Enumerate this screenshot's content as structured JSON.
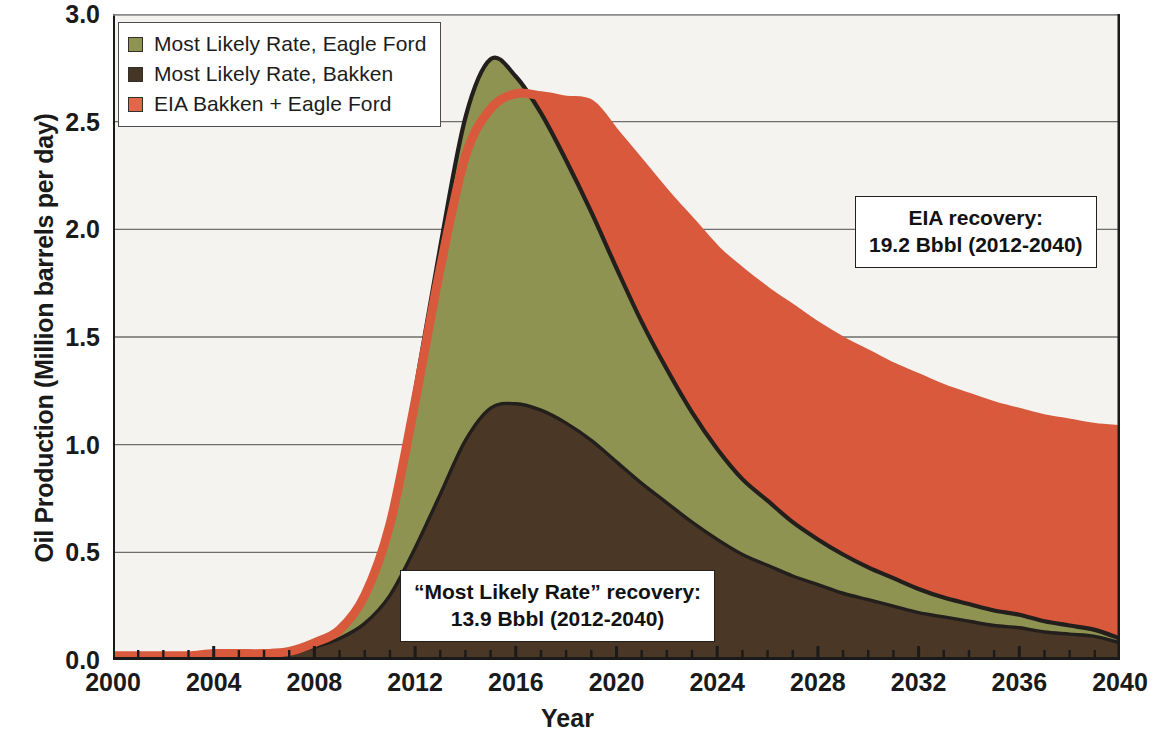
{
  "chart_data": {
    "type": "area",
    "title": "",
    "xlabel": "Year",
    "ylabel": "Oil Production (Million barrels per day)",
    "xlim": [
      2000,
      2040
    ],
    "ylim": [
      0.0,
      3.0
    ],
    "ytick_labels": [
      "0.0",
      "0.5",
      "1.0",
      "1.5",
      "2.0",
      "2.5",
      "3.0"
    ],
    "ytick_values": [
      0.0,
      0.5,
      1.0,
      1.5,
      2.0,
      2.5,
      3.0
    ],
    "xtick_labels": [
      "2000",
      "2004",
      "2008",
      "2012",
      "2016",
      "2020",
      "2024",
      "2028",
      "2032",
      "2036",
      "2040"
    ],
    "xtick_values": [
      2000,
      2004,
      2008,
      2012,
      2016,
      2020,
      2024,
      2028,
      2032,
      2036,
      2040
    ],
    "minor_xtick_interval": 1,
    "grid": "horizontal",
    "legend_position": "upper-left",
    "x": [
      2000,
      2001,
      2002,
      2003,
      2004,
      2005,
      2006,
      2007,
      2008,
      2009,
      2010,
      2011,
      2012,
      2013,
      2014,
      2015,
      2016,
      2017,
      2018,
      2019,
      2020,
      2021,
      2022,
      2023,
      2024,
      2025,
      2026,
      2027,
      2028,
      2029,
      2030,
      2031,
      2032,
      2033,
      2034,
      2035,
      2036,
      2037,
      2038,
      2039,
      2040
    ],
    "series": [
      {
        "name": "Most Likely Rate, Bakken",
        "color": "#4a3725",
        "stacking": "bottom-layer",
        "values": [
          0.01,
          0.01,
          0.01,
          0.01,
          0.02,
          0.02,
          0.02,
          0.03,
          0.06,
          0.1,
          0.17,
          0.3,
          0.52,
          0.77,
          1.02,
          1.17,
          1.19,
          1.16,
          1.1,
          1.02,
          0.92,
          0.82,
          0.73,
          0.64,
          0.56,
          0.49,
          0.44,
          0.39,
          0.35,
          0.31,
          0.28,
          0.25,
          0.22,
          0.2,
          0.18,
          0.16,
          0.15,
          0.13,
          0.12,
          0.11,
          0.08
        ]
      },
      {
        "name": "Most Likely Rate, Eagle Ford",
        "color": "#8e9352",
        "stacking": "stacked-on-bakken",
        "values": [
          0.0,
          0.0,
          0.0,
          0.0,
          0.0,
          0.0,
          0.0,
          0.0,
          0.01,
          0.03,
          0.12,
          0.33,
          0.73,
          1.15,
          1.5,
          1.62,
          1.52,
          1.38,
          1.22,
          1.06,
          0.9,
          0.75,
          0.62,
          0.51,
          0.42,
          0.35,
          0.3,
          0.25,
          0.21,
          0.18,
          0.15,
          0.13,
          0.11,
          0.09,
          0.08,
          0.07,
          0.06,
          0.05,
          0.04,
          0.03,
          0.02
        ]
      },
      {
        "name": "Most Likely Rate, Total",
        "color": "#231f1c",
        "stacking": "total-outline",
        "values": [
          0.01,
          0.01,
          0.01,
          0.01,
          0.02,
          0.02,
          0.02,
          0.03,
          0.07,
          0.13,
          0.29,
          0.63,
          1.25,
          1.92,
          2.52,
          2.79,
          2.71,
          2.54,
          2.32,
          2.08,
          1.82,
          1.57,
          1.35,
          1.15,
          0.98,
          0.84,
          0.74,
          0.64,
          0.56,
          0.49,
          0.43,
          0.38,
          0.33,
          0.29,
          0.26,
          0.23,
          0.21,
          0.18,
          0.16,
          0.14,
          0.1
        ]
      },
      {
        "name": "EIA Bakken + Eagle Ford",
        "color": "#d9593c",
        "stacking": "envelope",
        "values": [
          0.02,
          0.02,
          0.02,
          0.02,
          0.03,
          0.03,
          0.03,
          0.04,
          0.08,
          0.14,
          0.3,
          0.63,
          1.2,
          1.82,
          2.34,
          2.56,
          2.63,
          2.62,
          2.6,
          2.58,
          2.44,
          2.3,
          2.16,
          2.03,
          1.9,
          1.8,
          1.71,
          1.63,
          1.55,
          1.48,
          1.42,
          1.36,
          1.31,
          1.26,
          1.22,
          1.18,
          1.15,
          1.12,
          1.1,
          1.08,
          1.07
        ]
      }
    ],
    "annotations": [
      {
        "id": "eia-recovery",
        "line1": "EIA recovery:",
        "line2": "19.2 Bbbl (2012-2040)"
      },
      {
        "id": "most-likely-recovery",
        "line1": "“Most Likely Rate” recovery:",
        "line2": "13.9 Bbbl (2012-2040)"
      }
    ]
  },
  "legend": {
    "items": [
      {
        "label": "Most Likely Rate, Eagle Ford",
        "swatch": "#8e9352"
      },
      {
        "label": "Most Likely Rate, Bakken",
        "swatch": "#453525"
      },
      {
        "label": "EIA Bakken + Eagle Ford",
        "swatch": "#e2674a"
      }
    ]
  },
  "colors": {
    "eagle_ford": "#8e9352",
    "bakken": "#4a3725",
    "eia": "#d9593c",
    "outline": "#231f1c",
    "plot_background": "#f4f3f0",
    "gridline": "#6e6e6e",
    "axis": "#1a1a1a",
    "text": "#1a1a1a"
  }
}
